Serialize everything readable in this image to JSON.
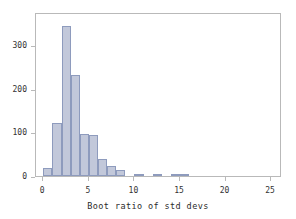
{
  "chart_data": {
    "type": "bar",
    "title": "",
    "subtitle": "",
    "xlabel": "Boot ratio of std devs",
    "ylabel": "",
    "xlim": [
      -0.8,
      26.2
    ],
    "ylim": [
      0,
      376
    ],
    "grid": false,
    "legend": null,
    "bin_width": 1,
    "xticks": [
      0,
      5,
      10,
      15,
      20,
      25
    ],
    "xtick_labels": [
      "0",
      "5",
      "10",
      "15",
      "20",
      "25"
    ],
    "yticks": [
      0,
      100,
      200,
      300
    ],
    "ytick_labels": [
      "0",
      "100",
      "200",
      "300"
    ],
    "bar_fill_color": "#c2c8da",
    "bar_edge_color": "#8e9bbd",
    "frame_color": "#b9b9b9",
    "categories": [
      "0-1",
      "1-2",
      "2-3",
      "3-4",
      "4-5",
      "5-6",
      "6-7",
      "7-8",
      "8-9",
      "9-10",
      "10-11",
      "11-12",
      "12-13",
      "13-14",
      "14-15",
      "15-16"
    ],
    "bin_starts": [
      0,
      1,
      2,
      3,
      4,
      5,
      6,
      7,
      8,
      9,
      10,
      11,
      12,
      13,
      14,
      15
    ],
    "values": [
      18,
      122,
      345,
      232,
      97,
      94,
      40,
      22,
      14,
      0,
      4,
      0,
      4,
      0,
      3,
      3
    ]
  }
}
